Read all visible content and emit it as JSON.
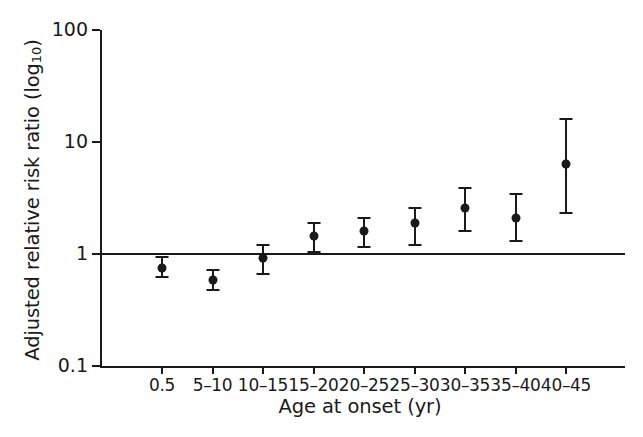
{
  "chart_data": {
    "type": "scatter",
    "title": "",
    "xlabel": "Age at onset (yr)",
    "ylabel_main": "Adjusted relative risk ratio (log",
    "ylabel_sub": "10",
    "ylabel_tail": ")",
    "ylabel_full": "Adjusted relative risk ratio (log10)",
    "yscale": "log10",
    "ylim": [
      0.1,
      100
    ],
    "ytick_labels": [
      "100",
      "10",
      "1",
      "0.1"
    ],
    "ytick_values": [
      100,
      10,
      1,
      0.1
    ],
    "grid": false,
    "legend": "none",
    "reference_line": 1,
    "categories": [
      "0.5",
      "5–10",
      "10–15",
      "15–20",
      "20–25",
      "25–30",
      "30–35",
      "35–40",
      "40–45"
    ],
    "values": [
      0.75,
      0.59,
      0.93,
      1.45,
      1.6,
      1.9,
      2.6,
      2.1,
      6.3
    ],
    "ci_low": [
      0.62,
      0.48,
      0.66,
      1.05,
      1.15,
      1.2,
      1.6,
      1.3,
      2.3
    ],
    "ci_high": [
      0.94,
      0.72,
      1.2,
      1.9,
      2.1,
      2.6,
      3.9,
      3.4,
      16.0
    ],
    "series_name": "Adjusted relative risk ratio",
    "marker": "filled-circle",
    "color": "#1a1a1a"
  },
  "axis": {
    "y_title_main": "Adjusted relative risk ratio (log",
    "y_title_sub": "10",
    "y_title_close": ")",
    "x_title": "Age at onset (yr)",
    "y_ticks": [
      {
        "label": "100",
        "value": 100
      },
      {
        "label": "10",
        "value": 10
      },
      {
        "label": "1",
        "value": 1
      },
      {
        "label": "0.1",
        "value": 0.1
      }
    ],
    "x_ticks": [
      {
        "label": "0.5"
      },
      {
        "label": "5–10"
      },
      {
        "label": "10–15"
      },
      {
        "label": "15–20"
      },
      {
        "label": "20–25"
      },
      {
        "label": "25–30"
      },
      {
        "label": "30–35"
      },
      {
        "label": "35–40"
      },
      {
        "label": "40–45"
      }
    ]
  }
}
